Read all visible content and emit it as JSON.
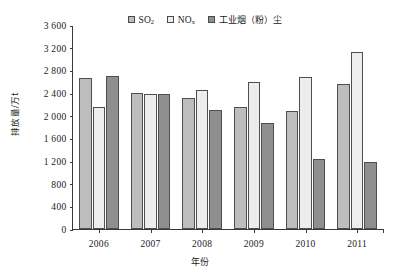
{
  "chart_data": {
    "type": "bar",
    "title": "",
    "xlabel": "年份",
    "ylabel": "排放量/万t",
    "categories": [
      "2006",
      "2007",
      "2008",
      "2009",
      "2010",
      "2011"
    ],
    "ylim": [
      0,
      3600
    ],
    "yticks": [
      "0",
      "400",
      "800",
      "1 200",
      "1 600",
      "2 000",
      "2 400",
      "2 800",
      "3 200",
      "3 600"
    ],
    "ytick_values": [
      0,
      400,
      800,
      1200,
      1600,
      2000,
      2400,
      2800,
      3200,
      3600
    ],
    "grid": false,
    "legend_position": "top-center",
    "series": [
      {
        "name": "SO2",
        "label": "SO",
        "label_sub": "2",
        "color": "#bdbdbd",
        "values": [
          2670,
          2400,
          2320,
          2150,
          2080,
          2560
        ]
      },
      {
        "name": "NOx",
        "label": "NO",
        "label_sub": "x",
        "color": "#ededed",
        "values": [
          2150,
          2380,
          2450,
          2600,
          2680,
          3120
        ]
      },
      {
        "name": "industrial-smoke-dust",
        "label": "工业烟（粉）尘",
        "label_sub": "",
        "color": "#8f8f8f",
        "values": [
          2700,
          2380,
          2100,
          1870,
          1230,
          1180
        ]
      }
    ]
  }
}
